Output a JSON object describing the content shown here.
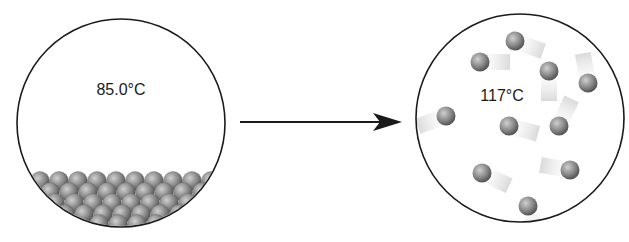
{
  "diagram": {
    "type": "phase-change-illustration",
    "left_state": {
      "name": "liquid",
      "temperature_label": "85.0°C",
      "circle": {
        "cx": 121,
        "cy": 123,
        "r": 104
      }
    },
    "right_state": {
      "name": "gas",
      "temperature_label": "117°C",
      "circle": {
        "cx": 520,
        "cy": 118,
        "r": 104
      },
      "particles": [
        {
          "x": 515,
          "y": 41,
          "trail_angle": 200
        },
        {
          "x": 480,
          "y": 62,
          "trail_angle": 180
        },
        {
          "x": 549,
          "y": 71,
          "trail_angle": 270
        },
        {
          "x": 588,
          "y": 83,
          "trail_angle": 80
        },
        {
          "x": 446,
          "y": 116,
          "trail_angle": 340
        },
        {
          "x": 509,
          "y": 126,
          "trail_angle": 195
        },
        {
          "x": 559,
          "y": 126,
          "trail_angle": 115
        },
        {
          "x": 482,
          "y": 173,
          "trail_angle": 205
        },
        {
          "x": 570,
          "y": 170,
          "trail_angle": 10
        },
        {
          "x": 528,
          "y": 206,
          "trail_angle": 250
        }
      ]
    },
    "arrow": {
      "x1": 240,
      "y1": 122,
      "x2": 400,
      "y2": 122,
      "direction": "right"
    },
    "colors": {
      "outline": "#1a1a1a",
      "particle_dark": "#555555",
      "particle_light": "#b8b8b8",
      "trail": "#e0e0e0"
    }
  }
}
